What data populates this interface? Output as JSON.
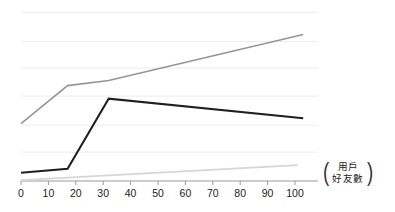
{
  "chart_data": {
    "type": "line",
    "title": "",
    "xlabel": "用戶好友數",
    "ylabel": "",
    "xlim": [
      0,
      105
    ],
    "ylim": [
      0,
      6
    ],
    "grid": true,
    "grid_axis": "y",
    "legend": "none",
    "xticks": [
      0,
      10,
      20,
      30,
      40,
      50,
      60,
      70,
      80,
      90,
      100
    ],
    "xticklabels": [
      "0",
      "10",
      "20",
      "30",
      "40",
      "50",
      "60",
      "70",
      "80",
      "90",
      "100"
    ],
    "yticks": [],
    "yticklabels": [],
    "series": [
      {
        "name": "series-mid-gray",
        "color": "#969696",
        "width": 1.6,
        "x": [
          0,
          17,
          32,
          103
        ],
        "y": [
          2.03,
          3.37,
          3.55,
          5.18
        ]
      },
      {
        "name": "series-dark",
        "color": "#1f1f1f",
        "width": 2.0,
        "x": [
          0,
          17,
          32,
          103
        ],
        "y": [
          0.29,
          0.43,
          2.91,
          2.22
        ]
      },
      {
        "name": "series-light-gray",
        "color": "#d6d6d6",
        "width": 1.6,
        "x": [
          0,
          101
        ],
        "y": [
          0.03,
          0.56
        ]
      }
    ],
    "gridline_values": [
      5.96,
      4.93,
      3.99,
      3.0,
      1.97,
      1.02
    ],
    "axis_color": "#9a9a9a",
    "grid_color": "#ececec"
  },
  "axis_caption": {
    "open_paren": "(",
    "line1": "用戶",
    "line2": "好友數",
    "close_paren": ")"
  }
}
